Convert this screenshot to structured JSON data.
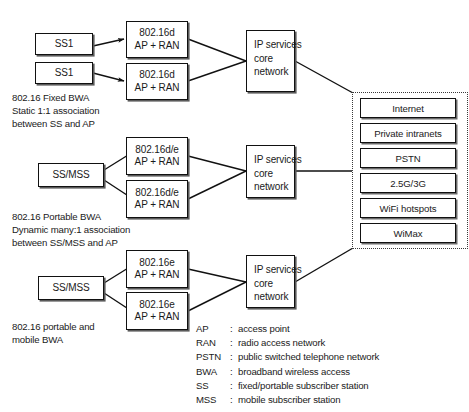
{
  "diagram": {
    "groups": [
      {
        "id": "fixed-bwa",
        "stations": [
          {
            "label": "SS1"
          },
          {
            "label": "SS1"
          }
        ],
        "access_points": [
          {
            "line1": "802.16d",
            "line2": "AP + RAN"
          },
          {
            "line1": "802.16d",
            "line2": "AP + RAN"
          }
        ],
        "core": {
          "line1": "IP services",
          "line2": "core",
          "line3": "network"
        },
        "caption": {
          "line1": "802.16 Fixed BWA",
          "line2": "Static 1:1 association",
          "line3": "between SS and AP"
        }
      },
      {
        "id": "portable-bwa",
        "stations": [
          {
            "label": "SS/MSS"
          }
        ],
        "access_points": [
          {
            "line1": "802.16d/e",
            "line2": "AP + RAN"
          },
          {
            "line1": "802.16d/e",
            "line2": "AP + RAN"
          }
        ],
        "core": {
          "line1": "IP services",
          "line2": "core",
          "line3": "network"
        },
        "caption": {
          "line1": "802.16 Portable BWA",
          "line2": "Dynamic many:1 association",
          "line3": "between SS/MSS and AP"
        }
      },
      {
        "id": "portable-mobile-bwa",
        "stations": [
          {
            "label": "SS/MSS"
          }
        ],
        "access_points": [
          {
            "line1": "802.16e",
            "line2": "AP + RAN"
          },
          {
            "line1": "802.16e",
            "line2": "AP + RAN"
          }
        ],
        "core": {
          "line1": "IP services",
          "line2": "core",
          "line3": "network"
        },
        "caption": {
          "line1": "802.16 portable and",
          "line2": "mobile BWA",
          "line3": ""
        }
      }
    ],
    "services": [
      {
        "label": "Internet"
      },
      {
        "label": "Private intranets"
      },
      {
        "label": "PSTN"
      },
      {
        "label": "2.5G/3G"
      },
      {
        "label": "WiFi hotspots"
      },
      {
        "label": "WiMax"
      }
    ],
    "legend": [
      {
        "abbr": "AP",
        "sep": ":",
        "definition": "access point"
      },
      {
        "abbr": "RAN",
        "sep": ":",
        "definition": "radio access network"
      },
      {
        "abbr": "PSTN",
        "sep": ":",
        "definition": "public switched telephone network"
      },
      {
        "abbr": "BWA",
        "sep": ":",
        "definition": "broadband wireless access"
      },
      {
        "abbr": "SS",
        "sep": ":",
        "definition": "fixed/portable subscriber station"
      },
      {
        "abbr": "MSS",
        "sep": ":",
        "definition": "mobile subscriber station"
      }
    ],
    "colors": {
      "stroke": "#111111",
      "shadow": "#5a5a5a",
      "background": "#ffffff",
      "dotted_border": "#3a3a3a"
    }
  }
}
